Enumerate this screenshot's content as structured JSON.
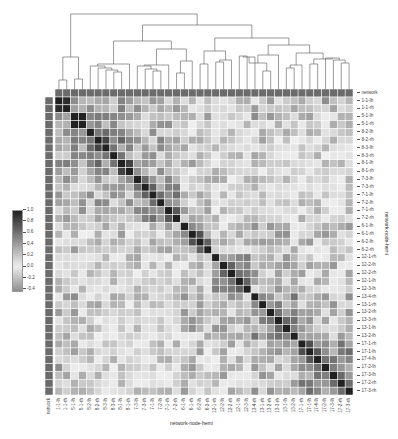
{
  "chart_data": {
    "type": "heatmap",
    "subtype": "clustermap",
    "title": "",
    "xlabel": "network-node-hemi",
    "ylabel": "network-node-hemi",
    "colorbar": {
      "ticks": [
        "1.0",
        "0.8",
        "0.6",
        "0.4",
        "0.2",
        "0.0",
        "-0.2",
        "-0.4"
      ],
      "range": [
        -0.45,
        1.0
      ],
      "colormap": "diverging gray (light at 0, dark at 1.0, mid-gray negative)"
    },
    "annotation_label": "network",
    "labels": [
      "1-1-lh",
      "1-1-rh",
      "5-1-lh",
      "5-1-rh",
      "8-2-lh",
      "8-2-rh",
      "8-3-lh",
      "8-3-rh",
      "8-1-lh",
      "8-1-rh",
      "7-3-lh",
      "7-3-rh",
      "7-1-lh",
      "7-2-lh",
      "7-1-rh",
      "7-2-rh",
      "6-1-lh",
      "6-1-rh",
      "6-2-lh",
      "6-2-rh",
      "12-1-rh",
      "12-2-lh",
      "12-2-rh",
      "12-1-lh",
      "12-3-lh",
      "13-4-rh",
      "13-1-rh",
      "13-2-rh",
      "13-3-rh",
      "13-1-lh",
      "13-2-lh",
      "17-1-rh",
      "17-1-lh",
      "17-4-lh",
      "17-2-lh",
      "17-3-lh",
      "17-2-rh",
      "17-3-rh"
    ],
    "groups": [
      0,
      0,
      1,
      1,
      2,
      2,
      2,
      2,
      2,
      2,
      3,
      3,
      3,
      3,
      3,
      3,
      4,
      4,
      4,
      4,
      5,
      5,
      5,
      5,
      5,
      6,
      6,
      6,
      6,
      6,
      6,
      7,
      7,
      7,
      7,
      7,
      7,
      7
    ],
    "group_within": [
      0.75,
      0.7,
      0.45,
      0.45,
      0.4,
      0.35,
      0.4,
      0.45
    ],
    "group_between": [
      [
        0.75,
        0.45,
        0.35,
        0.3,
        0.2,
        0.1,
        0.2,
        0.25
      ],
      [
        0.45,
        0.7,
        0.35,
        0.3,
        0.2,
        0.15,
        0.25,
        0.2
      ],
      [
        0.35,
        0.35,
        0.45,
        0.3,
        0.2,
        0.1,
        0.15,
        0.1
      ],
      [
        0.3,
        0.3,
        0.3,
        0.45,
        0.25,
        0.15,
        0.1,
        0.1
      ],
      [
        0.2,
        0.2,
        0.2,
        0.25,
        0.4,
        0.2,
        0.25,
        0.2
      ],
      [
        0.1,
        0.15,
        0.1,
        0.15,
        0.2,
        0.35,
        0.25,
        0.2
      ],
      [
        0.2,
        0.25,
        0.15,
        0.1,
        0.25,
        0.25,
        0.4,
        0.25
      ],
      [
        0.25,
        0.2,
        0.1,
        0.1,
        0.2,
        0.2,
        0.25,
        0.45
      ]
    ],
    "network_color": "#6b6b6b"
  }
}
